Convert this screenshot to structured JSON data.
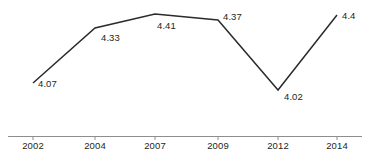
{
  "chart_data": {
    "type": "line",
    "title": "",
    "subtitle": "",
    "xlabel": "",
    "ylabel": "",
    "grid": false,
    "legend": "none",
    "categories": [
      "2002",
      "2004",
      "2007",
      "2009",
      "2012",
      "2014"
    ],
    "x": [
      2002,
      2004,
      2007,
      2009,
      2012,
      2014
    ],
    "values": [
      4.07,
      4.33,
      4.41,
      4.37,
      4.02,
      4.4
    ],
    "point_labels": [
      "4.07",
      "4.33",
      "4.41",
      "4.37",
      "4.02",
      "4.4"
    ],
    "xlim": [
      2002,
      2014
    ],
    "ylim": [
      4.0,
      4.43
    ],
    "series": [
      {
        "name": "",
        "values": [
          4.07,
          4.33,
          4.41,
          4.37,
          4.02,
          4.4
        ],
        "color": "#2b2b2b"
      }
    ],
    "axis": {
      "x_axis_visible": true,
      "y_axis_visible": false,
      "axis_color": "#8e8e8e"
    },
    "annotations": []
  },
  "geometry": {
    "points": [
      {
        "cx": 33,
        "cy": 83,
        "label": "4.07",
        "lx": 38,
        "ly": 78,
        "anchor": "below-right"
      },
      {
        "cx": 95,
        "cy": 28,
        "label": "4.33",
        "lx": 101,
        "ly": 32,
        "anchor": "below-right"
      },
      {
        "cx": 155,
        "cy": 14,
        "label": "4.41",
        "lx": 157,
        "ly": 20,
        "anchor": "below-right"
      },
      {
        "cx": 218,
        "cy": 20,
        "label": "4.37",
        "lx": 223,
        "ly": 11,
        "anchor": "above-right"
      },
      {
        "cx": 278,
        "cy": 90,
        "label": "4.02",
        "lx": 284,
        "ly": 91,
        "anchor": "below-right"
      },
      {
        "cx": 337,
        "cy": 15,
        "label": "4.4",
        "lx": 342,
        "ly": 10,
        "anchor": "above-right"
      }
    ],
    "polyline": "33,83 95,28 155,14 218,20 278,90 337,15",
    "tick_x": [
      33,
      95,
      155,
      218,
      278,
      337
    ],
    "tick_label_y": 140
  },
  "ticks": [
    {
      "label": "2002",
      "x": 33
    },
    {
      "label": "2004",
      "x": 95
    },
    {
      "label": "2007",
      "x": 155
    },
    {
      "label": "2009",
      "x": 218
    },
    {
      "label": "2012",
      "x": 278
    },
    {
      "label": "2014",
      "x": 337
    }
  ],
  "colors": {
    "line": "#2b2b2b",
    "axis": "#8e8e8e",
    "text": "#231f20",
    "background": "#ffffff"
  }
}
